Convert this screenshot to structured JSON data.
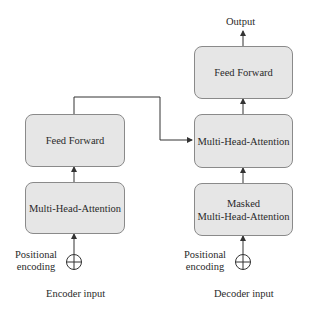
{
  "diagram": {
    "output_label": "Output",
    "encoder": {
      "feed_forward": "Feed Forward",
      "attention": "Multi-Head-Attention",
      "positional_encoding": [
        "Positional",
        "encoding"
      ],
      "input_label": "Encoder input"
    },
    "decoder": {
      "feed_forward": "Feed Forward",
      "cross_attention": "Multi-Head-Attention",
      "masked_attention": [
        "Masked",
        "Multi-Head-Attention"
      ],
      "positional_encoding": [
        "Positional",
        "encoding"
      ],
      "input_label": "Decoder input"
    },
    "colors": {
      "box_fill": "#e6e6e6",
      "box_border": "#8a8a8a",
      "line": "#333333"
    }
  }
}
